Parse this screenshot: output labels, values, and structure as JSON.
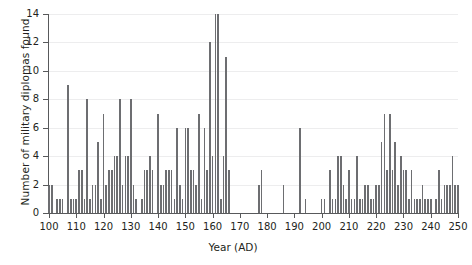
{
  "chart_data": {
    "type": "bar",
    "title": "",
    "xlabel": "Year (AD)",
    "ylabel": "Number of military diplomas found",
    "xlim": [
      100,
      250
    ],
    "ylim": [
      0,
      14
    ],
    "grid": "horizontal",
    "legend": "none",
    "bar_color": "#6d6e71",
    "axis_color": "#58595b",
    "grid_color": "#ededee",
    "xticks": [
      100,
      110,
      120,
      130,
      140,
      150,
      160,
      170,
      180,
      190,
      200,
      210,
      220,
      230,
      240,
      250
    ],
    "xtick_labels": [
      "100",
      "110",
      "120",
      "130",
      "140",
      "150",
      "160",
      "170",
      "180",
      "190",
      "200",
      "210",
      "220",
      "230",
      "240",
      "250"
    ],
    "yticks": [
      0,
      2,
      4,
      6,
      8,
      10,
      12,
      14
    ],
    "ytick_labels": [
      "0",
      "2",
      "4",
      "6",
      "8",
      "10",
      "12",
      "14"
    ],
    "x": [
      100,
      101,
      102,
      103,
      104,
      105,
      106,
      107,
      108,
      109,
      110,
      111,
      112,
      113,
      114,
      115,
      116,
      117,
      118,
      119,
      120,
      121,
      122,
      123,
      124,
      125,
      126,
      127,
      128,
      129,
      130,
      131,
      132,
      133,
      134,
      135,
      136,
      137,
      138,
      139,
      140,
      141,
      142,
      143,
      144,
      145,
      146,
      147,
      148,
      149,
      150,
      151,
      152,
      153,
      154,
      155,
      156,
      157,
      158,
      159,
      160,
      161,
      162,
      163,
      164,
      165,
      166,
      167,
      168,
      169,
      170,
      171,
      172,
      173,
      174,
      175,
      176,
      177,
      178,
      179,
      180,
      181,
      182,
      183,
      184,
      185,
      186,
      187,
      188,
      189,
      190,
      191,
      192,
      193,
      194,
      195,
      196,
      197,
      198,
      199,
      200,
      201,
      202,
      203,
      204,
      205,
      206,
      207,
      208,
      209,
      210,
      211,
      212,
      213,
      214,
      215,
      216,
      217,
      218,
      219,
      220,
      221,
      222,
      223,
      224,
      225,
      226,
      227,
      228,
      229,
      230,
      231,
      232,
      233,
      234,
      235,
      236,
      237,
      238,
      239,
      240,
      241,
      242,
      243,
      244,
      245,
      246,
      247,
      248,
      249,
      250
    ],
    "values": [
      2,
      2,
      0,
      1,
      1,
      1,
      0,
      9,
      1,
      1,
      1,
      3,
      3,
      1,
      8,
      1,
      2,
      2,
      5,
      1,
      7,
      2,
      3,
      3,
      4,
      4,
      8,
      2,
      4,
      4,
      8,
      2,
      1,
      0,
      1,
      3,
      3,
      4,
      3,
      0,
      7,
      2,
      2,
      3,
      3,
      3,
      1,
      6,
      2,
      1,
      6,
      6,
      3,
      3,
      2,
      7,
      1,
      6,
      3,
      12,
      4,
      14,
      14,
      1,
      4,
      11,
      3,
      0,
      0,
      0,
      0,
      0,
      0,
      0,
      0,
      0,
      0,
      2,
      3,
      0,
      0,
      0,
      0,
      0,
      0,
      0,
      2,
      0,
      0,
      0,
      0,
      0,
      6,
      0,
      1,
      0,
      0,
      0,
      0,
      0,
      1,
      1,
      0,
      3,
      1,
      1,
      4,
      4,
      2,
      1,
      3,
      1,
      1,
      4,
      1,
      1,
      2,
      2,
      1,
      1,
      2,
      2,
      5,
      7,
      3,
      7,
      3,
      5,
      2,
      4,
      3,
      3,
      1,
      3,
      1,
      1,
      1,
      2,
      1,
      1,
      1,
      0,
      1,
      3,
      1,
      2,
      2,
      2,
      4,
      2,
      2
    ],
    "series_name": "military diplomas found per year"
  }
}
